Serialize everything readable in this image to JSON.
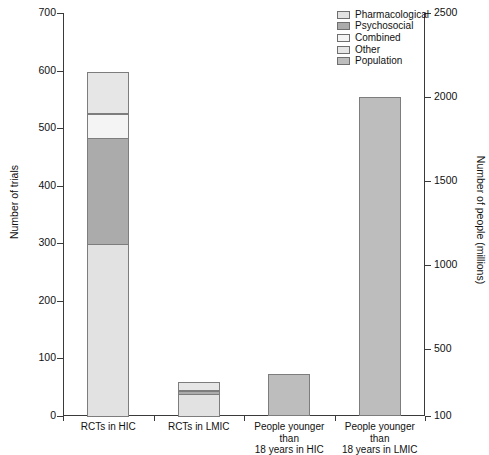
{
  "chart_data": {
    "type": "bar",
    "subtype": "stacked-bar-dual-axis",
    "title": "",
    "subtitle": "",
    "categories": [
      "RCTs in HIC",
      "RCTs in LMIC",
      "People younger than 18 years in HIC",
      "People younger than 18 years in LMIC"
    ],
    "category_labels_wrapped": [
      [
        "RCTs in HIC"
      ],
      [
        "RCTs in LMIC"
      ],
      [
        "People younger than",
        "18 years in HIC"
      ],
      [
        "People younger than",
        "18 years in LMIC"
      ]
    ],
    "series": [
      {
        "name": "Pharmacological",
        "color": "#e2e2e2",
        "axis": "left",
        "values": [
          300,
          40,
          0,
          0
        ]
      },
      {
        "name": "Psychosocial",
        "color": "#ababab",
        "axis": "left",
        "values": [
          187,
          7,
          0,
          0
        ]
      },
      {
        "name": "Combined",
        "color": "#f4f4f4",
        "axis": "left",
        "values": [
          43,
          0,
          0,
          0
        ]
      },
      {
        "name": "Other",
        "color": "#e6e6e6",
        "axis": "left",
        "values": [
          73,
          15,
          0,
          0
        ]
      },
      {
        "name": "Population",
        "color": "#bdbdbd",
        "axis": "right",
        "values": [
          0,
          0,
          350,
          2000
        ]
      }
    ],
    "bar_totals_left_axis": [
      603,
      62,
      65,
      558
    ],
    "bar_totals_right_axis": [
      null,
      null,
      350,
      2000
    ],
    "xlabel": "",
    "ylabel": "Number of trials",
    "ylabel_right": "Number of people (millions)",
    "ylim": [
      0,
      700
    ],
    "ylim_right": [
      100,
      2500
    ],
    "yticks": [
      0,
      100,
      200,
      300,
      400,
      500,
      600,
      700
    ],
    "yticks_right": [
      100,
      500,
      1000,
      1500,
      2000,
      2500
    ],
    "grid": false,
    "legend_position": "top-right",
    "legend_entries": [
      "Pharmacological",
      "Psychosocial",
      "Combined",
      "Other",
      "Population"
    ]
  },
  "axes": {
    "left": {
      "title": "Number of trials",
      "ticks": [
        "700",
        "600",
        "500",
        "400",
        "300",
        "200",
        "100",
        "0"
      ]
    },
    "right": {
      "title": "Number of people (millions)",
      "ticks": [
        "2500",
        "2000",
        "1500",
        "1000",
        "500",
        "100"
      ]
    }
  },
  "legend": {
    "items": [
      {
        "label": "Pharmacological",
        "color": "#e2e2e2"
      },
      {
        "label": "Psychosocial",
        "color": "#ababab"
      },
      {
        "label": "Combined",
        "color": "#f4f4f4"
      },
      {
        "label": "Other",
        "color": "#e6e6e6"
      },
      {
        "label": "Population",
        "color": "#bdbdbd"
      }
    ]
  },
  "style": {
    "axis_color": "#3a3a3a",
    "bar_outline": "#7d7d7d",
    "background": "#ffffff",
    "text_color": "#111111"
  }
}
